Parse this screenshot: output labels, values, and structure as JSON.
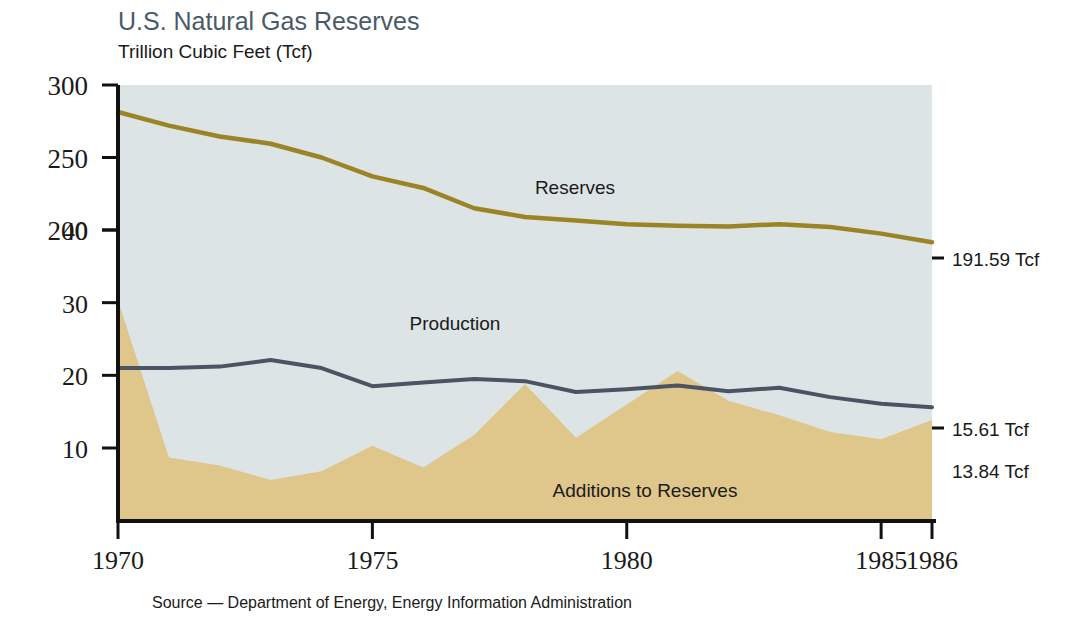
{
  "chart_data": {
    "type": "area",
    "title": "U.S. Natural Gas Reserves",
    "subtitle": "Trillion Cubic Feet (Tcf)",
    "source_note": "Source — Department of Energy, Energy Information Administration",
    "xlabel": "",
    "ylabel": "",
    "x": [
      1970,
      1971,
      1972,
      1973,
      1974,
      1975,
      1976,
      1977,
      1978,
      1979,
      1980,
      1981,
      1982,
      1983,
      1984,
      1985,
      1986
    ],
    "xticks": [
      "1970",
      "1975",
      "1980",
      "1985",
      "1986"
    ],
    "xtick_values": [
      1970,
      1975,
      1980,
      1985,
      1986
    ],
    "xlim": [
      1970,
      1986
    ],
    "axes": [
      {
        "name": "reserves-axis",
        "ticks": [
          "300",
          "250",
          "200"
        ],
        "tick_values": [
          300,
          250,
          200
        ],
        "ylim": [
          0,
          300
        ]
      },
      {
        "name": "production-axis",
        "ticks": [
          "40",
          "30",
          "20",
          "10"
        ],
        "tick_values": [
          40,
          30,
          20,
          10
        ],
        "ylim": [
          0,
          40
        ]
      }
    ],
    "series": [
      {
        "name": "Reserves",
        "label": "Reserves",
        "axis": "reserves-axis",
        "render": "line",
        "color": "#9b8425",
        "end_label": "191.59 Tcf",
        "values": [
          281.4,
          272.0,
          264.5,
          259.5,
          250.0,
          237.0,
          229.0,
          215.0,
          209.0,
          206.5,
          204.0,
          203.0,
          202.5,
          204.0,
          202.0,
          197.5,
          191.59
        ]
      },
      {
        "name": "Production",
        "label": "Production",
        "axis": "production-axis",
        "render": "line",
        "color": "#4a5462",
        "end_label": "15.61 Tcf",
        "values": [
          21.0,
          21.0,
          21.2,
          22.1,
          21.0,
          18.5,
          19.0,
          19.5,
          19.2,
          17.7,
          18.1,
          18.6,
          17.8,
          18.3,
          17.0,
          16.1,
          15.61
        ]
      },
      {
        "name": "Additions to Reserves",
        "label": "Additions to Reserves",
        "axis": "production-axis",
        "render": "area",
        "color": "#dfc68b",
        "end_label": "13.84 Tcf",
        "values": [
          30.3,
          8.7,
          7.6,
          5.6,
          6.8,
          10.3,
          7.3,
          11.8,
          18.8,
          11.4,
          16.0,
          20.6,
          16.5,
          14.5,
          12.2,
          11.2,
          13.84
        ]
      }
    ],
    "fills": {
      "reserves_band": "#dde4e6"
    },
    "grid": false,
    "legend": "inline-annotations"
  },
  "colors": {
    "title": "#4a5a66",
    "axis": "#111111",
    "reserves_line": "#9b8425",
    "production_line": "#4a5462",
    "additions_fill": "#dfc68b",
    "reserves_fill": "#dde4e6",
    "text": "#1a1a1a",
    "background": "#ffffff"
  },
  "geometry": {
    "plot_left": 118,
    "plot_right": 932,
    "plot_top": 85,
    "plot_bottom": 521,
    "y_reserves_300": 85,
    "y_reserves_200": 230,
    "y_inner_40": 230,
    "y_inner_10": 448,
    "reserves_end_y": 258,
    "production_end_y": 428,
    "additions_end_y": 470
  },
  "annotations": {
    "reserves_label_pos": {
      "x": 575,
      "y": 194
    },
    "production_label_pos": {
      "x": 455,
      "y": 330
    },
    "additions_label_pos": {
      "x": 645,
      "y": 497
    }
  }
}
